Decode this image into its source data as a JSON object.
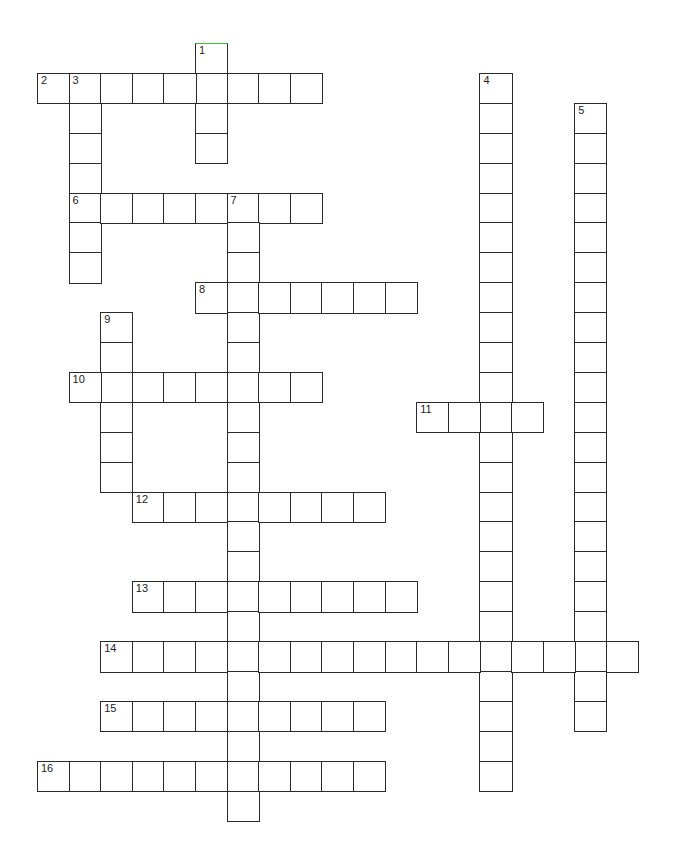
{
  "puzzle": {
    "type": "crossword",
    "grid": {
      "origin_x": 37,
      "origin_y": 43,
      "cell_w": 31.6,
      "cell_h": 29.9
    },
    "entries": [
      {
        "number": "1",
        "direction": "down",
        "row": 0,
        "col": 5,
        "length": 4,
        "highlight_top": "#3fbf3f"
      },
      {
        "number": "2",
        "direction": "across",
        "row": 1,
        "col": 0,
        "length": 9
      },
      {
        "number": "3",
        "direction": "down",
        "row": 1,
        "col": 1,
        "length": 7
      },
      {
        "number": "4",
        "direction": "down",
        "row": 1,
        "col": 14,
        "length": 24
      },
      {
        "number": "5",
        "direction": "down",
        "row": 2,
        "col": 17,
        "length": 21
      },
      {
        "number": "6",
        "direction": "across",
        "row": 5,
        "col": 1,
        "length": 8
      },
      {
        "number": "7",
        "direction": "down",
        "row": 5,
        "col": 6,
        "length": 21
      },
      {
        "number": "8",
        "direction": "across",
        "row": 8,
        "col": 5,
        "length": 7
      },
      {
        "number": "9",
        "direction": "down",
        "row": 9,
        "col": 2,
        "length": 6
      },
      {
        "number": "10",
        "direction": "across",
        "row": 11,
        "col": 1,
        "length": 8
      },
      {
        "number": "11",
        "direction": "across",
        "row": 12,
        "col": 12,
        "length": 4
      },
      {
        "number": "12",
        "direction": "across",
        "row": 15,
        "col": 3,
        "length": 8
      },
      {
        "number": "13",
        "direction": "across",
        "row": 18,
        "col": 3,
        "length": 9
      },
      {
        "number": "14",
        "direction": "across",
        "row": 20,
        "col": 2,
        "length": 17
      },
      {
        "number": "15",
        "direction": "across",
        "row": 22,
        "col": 2,
        "length": 9
      },
      {
        "number": "16",
        "direction": "across",
        "row": 24,
        "col": 0,
        "length": 11
      }
    ]
  }
}
